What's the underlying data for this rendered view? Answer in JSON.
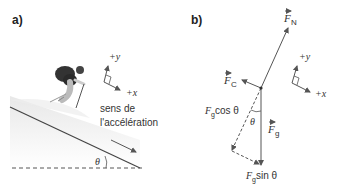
{
  "panel_a": {
    "label": "a)",
    "axis_y": "+y",
    "axis_x": "+x",
    "accel_line1": "sens de",
    "accel_line2": "l'accélération",
    "angle": "θ"
  },
  "panel_b": {
    "label": "b)",
    "fn": "F",
    "fn_sub": "N",
    "fc": "F",
    "fc_sub": "C",
    "fg": "F",
    "fg_sub": "g",
    "fg_cos_f": "F",
    "fg_cos_sub": "g",
    "fg_cos_rest": " cos θ",
    "fg_sin_f": "F",
    "fg_sin_sub": "g",
    "fg_sin_rest": " sin θ",
    "angle": "θ",
    "axis_y": "+y",
    "axis_x": "+x"
  },
  "colors": {
    "line": "#555555",
    "slope": "#444444",
    "snow": "#e6e6e6"
  }
}
